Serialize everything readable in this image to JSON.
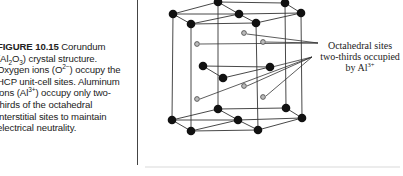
{
  "caption": {
    "figure_label": "FIGURE 10.15",
    "title_rest": " Corundum (Al",
    "sub1": "2",
    "mid1": "O",
    "sub2": "3",
    "mid2": ") crystal structure. Oxygen ions (O",
    "sup1": "2−",
    "mid3": ") occupy the HCP unit-cell sites. Aluminum ions (Al",
    "sup2": "3+",
    "end": ") occupy only two-thirds of the octahedral interstitial sites to maintain electrical neutrality."
  },
  "annotation": {
    "line1": "Octahedral sites",
    "line2": "two-thirds occupied",
    "line3_prefix": "by Al",
    "line3_sup": "3+"
  },
  "colors": {
    "sphere": "#111111",
    "line": "#333333",
    "site": "#666666"
  }
}
